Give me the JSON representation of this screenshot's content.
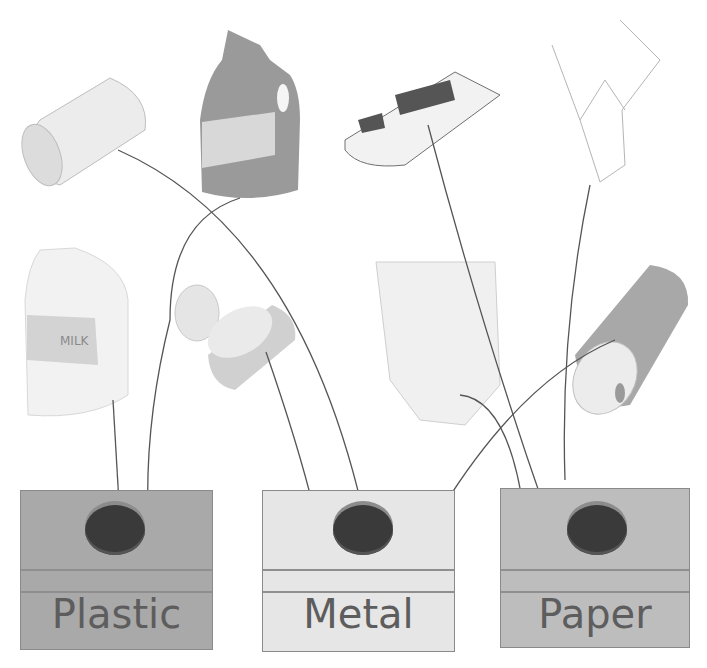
{
  "worksheet": {
    "type": "recycling sorting activity",
    "items": [
      {
        "name": "tin can",
        "sorted_to": "Metal"
      },
      {
        "name": "detergent bottle",
        "sorted_to": "Plastic"
      },
      {
        "name": "newspaper",
        "sorted_to": "Paper"
      },
      {
        "name": "cardboard box",
        "sorted_to": "Paper"
      },
      {
        "name": "milk jug",
        "sorted_to": "Plastic"
      },
      {
        "name": "open food can",
        "sorted_to": "Metal"
      },
      {
        "name": "paper bag",
        "sorted_to": "Paper"
      },
      {
        "name": "aerosol can",
        "sorted_to": "Metal"
      }
    ],
    "milk_label": "MILK",
    "bins": [
      {
        "label": "Plastic",
        "color": "#a9a9a9"
      },
      {
        "label": "Metal",
        "color": "#e6e6e6"
      },
      {
        "label": "Paper",
        "color": "#bdbdbd"
      }
    ]
  }
}
